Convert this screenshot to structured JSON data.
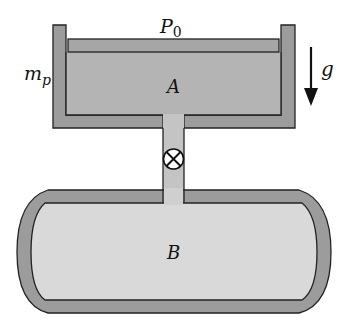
{
  "labels": {
    "ambient_pressure": "P",
    "ambient_pressure_sub": "0",
    "piston_mass": "m",
    "piston_mass_sub": "p",
    "gravity": "g",
    "chamber_a": "A",
    "tank_b": "B"
  },
  "colors": {
    "wall": "#9c9c9c",
    "gas_a": "#b4b4b4",
    "gas_b": "#d9d9d9",
    "stroke": "#222222",
    "background": "#ffffff"
  }
}
